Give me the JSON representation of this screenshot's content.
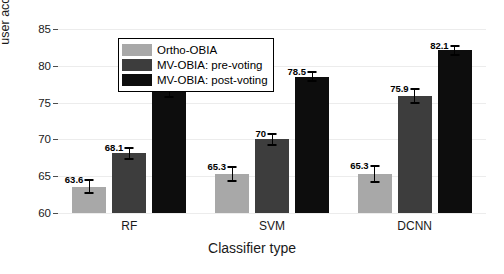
{
  "chart_data": {
    "type": "bar",
    "title": "",
    "xlabel": "Classifier type",
    "ylabel": "user accuracy(%)",
    "categories": [
      "RF",
      "SVM",
      "DCNN"
    ],
    "ylim": [
      60,
      86.5
    ],
    "yticks": [
      60,
      65,
      70,
      75,
      80,
      85
    ],
    "ytick_labels": [
      "60",
      "65",
      "70",
      "75",
      "80",
      "85"
    ],
    "grid": true,
    "legend_position": "upper left (inside axes)",
    "series": [
      {
        "name": "Ortho-OBIA",
        "color": "#a8a8a8",
        "values": [
          63.6,
          65.3,
          65.3
        ],
        "value_labels": [
          "63.6",
          "65.3",
          "65.3"
        ],
        "error_low": [
          0.9,
          1.0,
          1.1
        ],
        "error_high": [
          0.9,
          1.0,
          1.1
        ]
      },
      {
        "name": "MV-OBIA: pre-voting",
        "color": "#3d3d3d",
        "values": [
          68.1,
          70.0,
          75.9
        ],
        "value_labels": [
          "68.1",
          "70",
          "75.9"
        ],
        "error_low": [
          0.8,
          0.7,
          1.0
        ],
        "error_high": [
          0.8,
          0.7,
          1.0
        ]
      },
      {
        "name": "MV-OBIA: post-voting",
        "color": "#0d0d0d",
        "values": [
          77.2,
          78.5,
          82.1
        ],
        "value_labels": [
          "77.2",
          "78.5",
          "82.1"
        ],
        "error_low": [
          1.5,
          0.6,
          0.6
        ],
        "error_high": [
          1.5,
          0.6,
          0.6
        ]
      }
    ]
  }
}
